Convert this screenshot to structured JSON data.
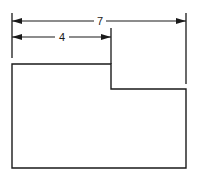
{
  "diagram": {
    "type": "dimensioned-shape",
    "stroke_color": "#1a1a1a",
    "background": "#ffffff",
    "dimensions": [
      {
        "id": "overall-width",
        "label": "7"
      },
      {
        "id": "partial-width",
        "label": "4"
      }
    ],
    "shape": "L-shaped outline (rectangle with stepped-down top-right corner)"
  }
}
